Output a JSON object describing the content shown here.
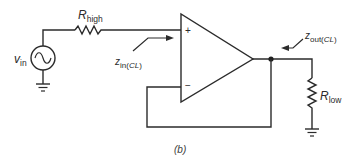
{
  "diagram": {
    "caption": "(b)",
    "source": {
      "symbol": "v",
      "subscript": "in",
      "type": "ac-voltage-source"
    },
    "resistor_high": {
      "symbol": "R",
      "subscript": "high"
    },
    "resistor_low": {
      "symbol": "R",
      "subscript": "low"
    },
    "opamp": {
      "noninverting_sign": "+",
      "inverting_sign": "−"
    },
    "z_in": {
      "symbol": "z",
      "subscript_plain": "in(",
      "subscript_italic": "CL",
      "subscript_close": ")"
    },
    "z_out": {
      "symbol": "z",
      "subscript_plain": "out(",
      "subscript_italic": "CL",
      "subscript_close": ")"
    },
    "colors": {
      "line": "#2b2b2b",
      "background": "#ffffff"
    }
  }
}
